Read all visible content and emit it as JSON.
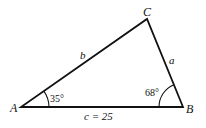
{
  "diagram": {
    "type": "triangle",
    "vertices": {
      "A": {
        "label": "A"
      },
      "B": {
        "label": "B"
      },
      "C": {
        "label": "C"
      }
    },
    "sides": {
      "a": {
        "label": "a"
      },
      "b": {
        "label": "b"
      },
      "c": {
        "label": "c = 25"
      }
    },
    "angles": {
      "A": {
        "label": "35°"
      },
      "B": {
        "label": "68°"
      }
    },
    "colors": {
      "stroke": "#111111",
      "background": "#ffffff"
    }
  }
}
